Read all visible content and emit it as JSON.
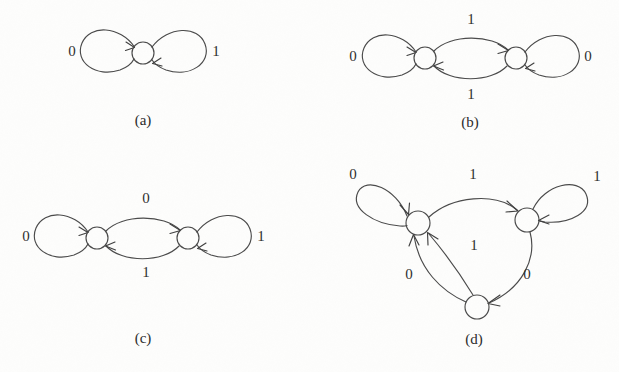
{
  "figure": {
    "kind": "state-transition-diagrams",
    "background_color": "#fdfdfc",
    "ink_color": "#4a4a4a",
    "panels": [
      {
        "id": "a",
        "caption": "(a)",
        "caption_pos": [
          143,
          122
        ],
        "nodes": [
          {
            "id": "a0",
            "cx": 143,
            "cy": 53,
            "r": 11
          }
        ],
        "labels": [
          {
            "text": "0",
            "x": 72,
            "y": 53
          },
          {
            "text": "1",
            "x": 216,
            "y": 53
          }
        ]
      },
      {
        "id": "b",
        "caption": "(b)",
        "caption_pos": [
          470,
          124
        ],
        "nodes": [
          {
            "id": "b0",
            "cx": 425,
            "cy": 58,
            "r": 11
          },
          {
            "id": "b1",
            "cx": 516,
            "cy": 58,
            "r": 11
          }
        ],
        "labels": [
          {
            "text": "0",
            "x": 353,
            "y": 58
          },
          {
            "text": "1",
            "x": 471,
            "y": 21
          },
          {
            "text": "1",
            "x": 471,
            "y": 96
          },
          {
            "text": "0",
            "x": 588,
            "y": 58
          }
        ]
      },
      {
        "id": "c",
        "caption": "(c)",
        "caption_pos": [
          143,
          340
        ],
        "nodes": [
          {
            "id": "c0",
            "cx": 97,
            "cy": 238,
            "r": 11
          },
          {
            "id": "c1",
            "cx": 188,
            "cy": 238,
            "r": 11
          }
        ],
        "labels": [
          {
            "text": "0",
            "x": 26,
            "y": 238
          },
          {
            "text": "0",
            "x": 146,
            "y": 200
          },
          {
            "text": "1",
            "x": 146,
            "y": 274
          },
          {
            "text": "1",
            "x": 261,
            "y": 238
          }
        ]
      },
      {
        "id": "d",
        "caption": "(d)",
        "caption_pos": [
          474,
          341
        ],
        "nodes": [
          {
            "id": "d0",
            "cx": 418,
            "cy": 223,
            "r": 12
          },
          {
            "id": "d1",
            "cx": 527,
            "cy": 220,
            "r": 12
          },
          {
            "id": "d2",
            "cx": 477,
            "cy": 307,
            "r": 12
          }
        ],
        "labels": [
          {
            "text": "0",
            "x": 353,
            "y": 176
          },
          {
            "text": "1",
            "x": 473,
            "y": 176
          },
          {
            "text": "1",
            "x": 597,
            "y": 178
          },
          {
            "text": "0",
            "x": 409,
            "y": 276
          },
          {
            "text": "1",
            "x": 474,
            "y": 247
          },
          {
            "text": "0",
            "x": 527,
            "y": 276
          }
        ]
      }
    ],
    "transitions": [
      {
        "panel": "a",
        "from": "a0",
        "to": "a0",
        "symbol": "0",
        "side": "left"
      },
      {
        "panel": "a",
        "from": "a0",
        "to": "a0",
        "symbol": "1",
        "side": "right"
      },
      {
        "panel": "b",
        "from": "b0",
        "to": "b0",
        "symbol": "0",
        "side": "left"
      },
      {
        "panel": "b",
        "from": "b0",
        "to": "b1",
        "symbol": "1",
        "side": "top"
      },
      {
        "panel": "b",
        "from": "b1",
        "to": "b0",
        "symbol": "1",
        "side": "bottom"
      },
      {
        "panel": "b",
        "from": "b1",
        "to": "b1",
        "symbol": "0",
        "side": "right"
      },
      {
        "panel": "c",
        "from": "c0",
        "to": "c0",
        "symbol": "0",
        "side": "left"
      },
      {
        "panel": "c",
        "from": "c0",
        "to": "c1",
        "symbol": "0",
        "side": "top"
      },
      {
        "panel": "c",
        "from": "c1",
        "to": "c0",
        "symbol": "1",
        "side": "bottom"
      },
      {
        "panel": "c",
        "from": "c1",
        "to": "c1",
        "symbol": "1",
        "side": "right"
      },
      {
        "panel": "d",
        "from": "d0",
        "to": "d0",
        "symbol": "0",
        "side": "upper-left"
      },
      {
        "panel": "d",
        "from": "d0",
        "to": "d1",
        "symbol": "1",
        "side": "top"
      },
      {
        "panel": "d",
        "from": "d1",
        "to": "d1",
        "symbol": "1",
        "side": "upper-right"
      },
      {
        "panel": "d",
        "from": "d1",
        "to": "d2",
        "symbol": "0",
        "side": "right-lower"
      },
      {
        "panel": "d",
        "from": "d2",
        "to": "d0",
        "symbol": "0",
        "side": "left-lower"
      },
      {
        "panel": "d",
        "from": "d2",
        "to": "d0",
        "symbol": "1",
        "side": "inner"
      }
    ]
  }
}
